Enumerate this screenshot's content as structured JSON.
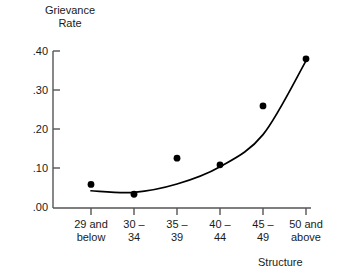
{
  "chart_data": {
    "type": "scatter",
    "title": "",
    "ylabel": "Grievance\nRate",
    "xlabel": "Structure",
    "categories": [
      "29 and\nbelow",
      "30 –\n34",
      "35 –\n39",
      "40 –\n44",
      "45 –\n49",
      "50 and\nabove"
    ],
    "values": [
      0.06,
      0.035,
      0.127,
      0.11,
      0.26,
      0.38
    ],
    "series": [
      {
        "name": "Grievance Rate",
        "values": [
          0.06,
          0.035,
          0.127,
          0.11,
          0.26,
          0.38
        ],
        "marker": "filled-circle",
        "color": "#000000"
      },
      {
        "name": "Fitted curve",
        "type": "line",
        "values": [
          0.044,
          0.04,
          0.061,
          0.105,
          0.187,
          0.375
        ],
        "color": "#000000"
      }
    ],
    "ylim": [
      0.0,
      0.4
    ],
    "yticks": [
      0.0,
      0.1,
      0.2,
      0.3,
      0.4
    ],
    "ytick_labels": [
      ".00",
      ".10",
      ".20",
      ".30",
      ".40"
    ],
    "grid": false,
    "legend": false,
    "axis_color": "#555555",
    "marker_color": "#000000",
    "curve_color": "#000000"
  },
  "axis": {
    "y_title_line1": "Grievance",
    "y_title_line2": "Rate",
    "x_title": "Structure",
    "ytick_0": ".40",
    "ytick_1": ".30",
    "ytick_2": ".20",
    "ytick_3": ".10",
    "ytick_4": ".00",
    "xtick_0": "29 and\nbelow",
    "xtick_1": "30 –\n34",
    "xtick_2": "35 –\n39",
    "xtick_3": "40 –\n44",
    "xtick_4": "45 –\n49",
    "xtick_5": "50 and\nabove"
  }
}
